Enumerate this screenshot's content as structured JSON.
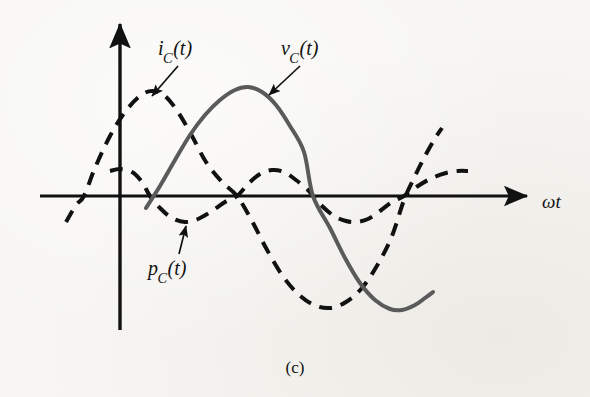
{
  "figure": {
    "caption": "(c)",
    "background_color": "#f7f6f3",
    "ink_color": "#111111",
    "solid_curve_color": "#5a5a5a"
  },
  "labels": {
    "ic": {
      "base": "i",
      "sub": "C",
      "arg": "(t)",
      "full": "i_C(t)"
    },
    "vc": {
      "base": "v",
      "sub": "C",
      "arg": "(t)",
      "full": "v_C(t)"
    },
    "pc": {
      "base": "p",
      "sub": "C",
      "arg": "(t)",
      "full": "p_C(t)"
    },
    "xaxis": "ωt"
  },
  "chart_data": {
    "type": "line",
    "title": "",
    "subtitle": "",
    "xlabel": "ωt",
    "ylabel": "",
    "grid": false,
    "legend_position": "inline-annotations",
    "axes": {
      "x_axis": {
        "x_start_px": 40,
        "x_end_px": 533,
        "y_px": 196,
        "arrow": "right"
      },
      "y_axis": {
        "y_top_px": 17,
        "y_bottom_px": 330,
        "x_px": 120,
        "arrow": "up"
      },
      "origin_px": [
        120,
        196
      ],
      "x_range_rad": [
        -0.85,
        4.55
      ],
      "y_range_normalized": [
        -1.35,
        1.35
      ]
    },
    "series": [
      {
        "name": "v_C(t)",
        "style": "solid",
        "color": "#5a5a5a",
        "width_px": 4,
        "description": "capacitor voltage, sinusoid starting at origin rising",
        "amplitude": 1.0,
        "phase_deg": 0,
        "points_px": [
          [
            146,
            208
          ],
          [
            160,
            186
          ],
          [
            175,
            160
          ],
          [
            190,
            135
          ],
          [
            205,
            115
          ],
          [
            220,
            100
          ],
          [
            235,
            90
          ],
          [
            248,
            87
          ],
          [
            262,
            92
          ],
          [
            276,
            105
          ],
          [
            290,
            126
          ],
          [
            304,
            152
          ],
          [
            313,
            196
          ],
          [
            330,
            228
          ],
          [
            345,
            258
          ],
          [
            360,
            283
          ],
          [
            375,
            300
          ],
          [
            390,
            309
          ],
          [
            402,
            310
          ],
          [
            415,
            305
          ],
          [
            425,
            298
          ],
          [
            433,
            292
          ]
        ]
      },
      {
        "name": "i_C(t)",
        "style": "dashed",
        "color": "#111111",
        "width_px": 4,
        "dash_px": [
          13,
          9
        ],
        "description": "capacitor current, leads voltage by 90 degrees",
        "amplitude": 1.05,
        "phase_deg": 90,
        "points_px": [
          [
            66,
            222
          ],
          [
            76,
            205
          ],
          [
            84,
            196
          ],
          [
            95,
            168
          ],
          [
            110,
            136
          ],
          [
            125,
            112
          ],
          [
            140,
            96
          ],
          [
            152,
            91
          ],
          [
            165,
            96
          ],
          [
            178,
            112
          ],
          [
            192,
            136
          ],
          [
            206,
            162
          ],
          [
            222,
            182
          ],
          [
            237,
            196
          ],
          [
            252,
            221
          ],
          [
            266,
            248
          ],
          [
            282,
            275
          ],
          [
            298,
            294
          ],
          [
            314,
            305
          ],
          [
            330,
            308
          ],
          [
            346,
            302
          ],
          [
            362,
            288
          ],
          [
            378,
            264
          ],
          [
            392,
            236
          ],
          [
            404,
            200
          ],
          [
            414,
            178
          ],
          [
            424,
            158
          ],
          [
            434,
            140
          ],
          [
            442,
            128
          ]
        ]
      },
      {
        "name": "p_C(t)",
        "style": "dashed",
        "color": "#111111",
        "width_px": 4,
        "dash_px": [
          13,
          9
        ],
        "description": "instantaneous capacitor power, double frequency, zero average",
        "amplitude": 0.2,
        "frequency_multiplier": 2,
        "points_px": [
          [
            110,
            171
          ],
          [
            120,
            169
          ],
          [
            132,
            172
          ],
          [
            142,
            182
          ],
          [
            150,
            196
          ],
          [
            160,
            208
          ],
          [
            172,
            218
          ],
          [
            185,
            222
          ],
          [
            198,
            219
          ],
          [
            212,
            211
          ],
          [
            225,
            202
          ],
          [
            237,
            196
          ],
          [
            248,
            184
          ],
          [
            260,
            174
          ],
          [
            272,
            170
          ],
          [
            284,
            172
          ],
          [
            296,
            180
          ],
          [
            308,
            190
          ],
          [
            313,
            196
          ],
          [
            322,
            206
          ],
          [
            334,
            216
          ],
          [
            346,
            221
          ],
          [
            356,
            222
          ],
          [
            368,
            219
          ],
          [
            380,
            211
          ],
          [
            392,
            202
          ],
          [
            404,
            196
          ],
          [
            418,
            186
          ],
          [
            432,
            178
          ],
          [
            446,
            173
          ],
          [
            458,
            171
          ],
          [
            468,
            171
          ]
        ]
      }
    ],
    "annotations": [
      {
        "text": "i_C(t)",
        "label_px": [
          180,
          52
        ],
        "arrow_from_px": [
          178,
          66
        ],
        "arrow_to_px": [
          152,
          96
        ],
        "target_series": "i_C(t)"
      },
      {
        "text": "v_C(t)",
        "label_px": [
          303,
          52
        ],
        "arrow_from_px": [
          300,
          66
        ],
        "arrow_to_px": [
          269,
          95
        ],
        "target_series": "v_C(t)"
      },
      {
        "text": "p_C(t)",
        "label_px": [
          172,
          266
        ],
        "arrow_from_px": [
          179,
          254
        ],
        "arrow_to_px": [
          186,
          226
        ],
        "target_series": "p_C(t)"
      }
    ]
  }
}
